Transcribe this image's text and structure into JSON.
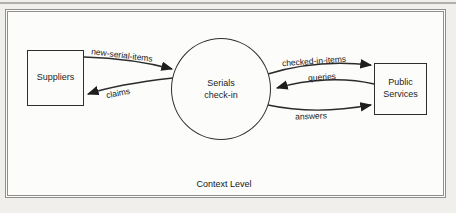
{
  "diagram": {
    "caption": "Context Level",
    "process": {
      "label": "Serials\ncheck-in"
    },
    "entities": [
      {
        "label": "Suppliers"
      },
      {
        "label": "Public\nServices"
      }
    ],
    "flows": [
      {
        "label": "new-serial-items",
        "from": "Suppliers",
        "to": "Serials check-in"
      },
      {
        "label": "claims",
        "from": "Serials check-in",
        "to": "Suppliers"
      },
      {
        "label": "checked-in-items",
        "from": "Serials check-in",
        "to": "Public Services"
      },
      {
        "label": "queries",
        "from": "Public Services",
        "to": "Serials check-in"
      },
      {
        "label": "answers",
        "from": "Serials check-in",
        "to": "Public Services"
      }
    ],
    "colors": {
      "background": "#f0efec",
      "paper": "#fcfcfb",
      "frame": "#8f8f8f",
      "line": "#2b2b2b",
      "text": "#1d1d1d"
    }
  }
}
